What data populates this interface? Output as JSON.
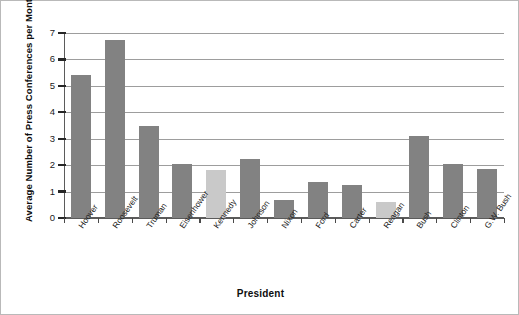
{
  "chart_data": {
    "type": "bar",
    "title": "",
    "xlabel": "President",
    "ylabel": "Average Number of Press Conferences per Month",
    "categories": [
      "Hoover",
      "Roosevelt",
      "Truman",
      "Eisenhower",
      "Kennedy",
      "Johnson",
      "Nixon",
      "Ford",
      "Carter",
      "Reagan",
      "Bush",
      "Clinton",
      "G.W. Bush"
    ],
    "values": [
      5.4,
      6.75,
      3.5,
      2.05,
      1.8,
      2.25,
      0.7,
      1.35,
      1.25,
      0.6,
      3.1,
      2.05,
      1.85
    ],
    "bar_colors": [
      "#828282",
      "#828282",
      "#828282",
      "#828282",
      "#c9c9c9",
      "#828282",
      "#828282",
      "#828282",
      "#828282",
      "#c9c9c9",
      "#828282",
      "#828282",
      "#828282"
    ],
    "ylim": [
      0,
      7
    ],
    "ytick_labels": [
      "0",
      "1",
      "2",
      "3",
      "4",
      "5",
      "6",
      "7"
    ],
    "ytick_values": [
      0,
      1,
      2,
      3,
      4,
      5,
      6,
      7
    ],
    "grid": true,
    "legend": "none",
    "colors": {
      "bar_default": "#828282",
      "bar_highlight": "#c9c9c9",
      "gridline": "#9d9d9d",
      "axis": "#5b5b5b",
      "text": "#1a1a1a",
      "frame": "#b9b9b9",
      "background": "#ffffff"
    }
  }
}
